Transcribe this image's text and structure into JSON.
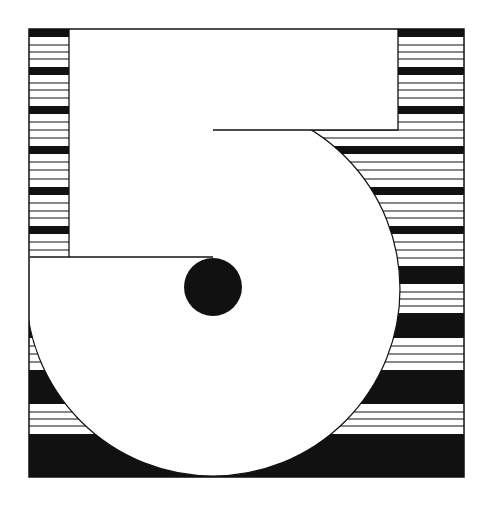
{
  "artwork": {
    "subject": "numeral 5",
    "colors": {
      "ink": "#111111",
      "paper": "#ffffff"
    },
    "frame": {
      "x": 29,
      "y": 29,
      "w": 435,
      "h": 448
    },
    "stripes": {
      "bands": [
        [
          29,
          37
        ],
        [
          67,
          75
        ],
        [
          106,
          114
        ],
        [
          146,
          154
        ],
        [
          187,
          195
        ],
        [
          226,
          234
        ],
        [
          266,
          284
        ],
        [
          313,
          338
        ],
        [
          370,
          404
        ],
        [
          434,
          477
        ]
      ],
      "lines": [
        45,
        52,
        59,
        83,
        90,
        98,
        122,
        130,
        138,
        162,
        170,
        179,
        203,
        211,
        218,
        242,
        250,
        258,
        292,
        299,
        306,
        346,
        354,
        362,
        412,
        419,
        426
      ]
    },
    "numeral": {
      "top_bar": {
        "x": 69,
        "y": 29,
        "w": 329,
        "h": 101
      },
      "stem": {
        "x": 69,
        "y": 29,
        "w": 144,
        "h": 228
      },
      "bowl": {
        "cx": 213,
        "cy": 289,
        "r": 187
      },
      "counter_dot": {
        "cx": 213,
        "cy": 287,
        "r": 29
      }
    }
  }
}
